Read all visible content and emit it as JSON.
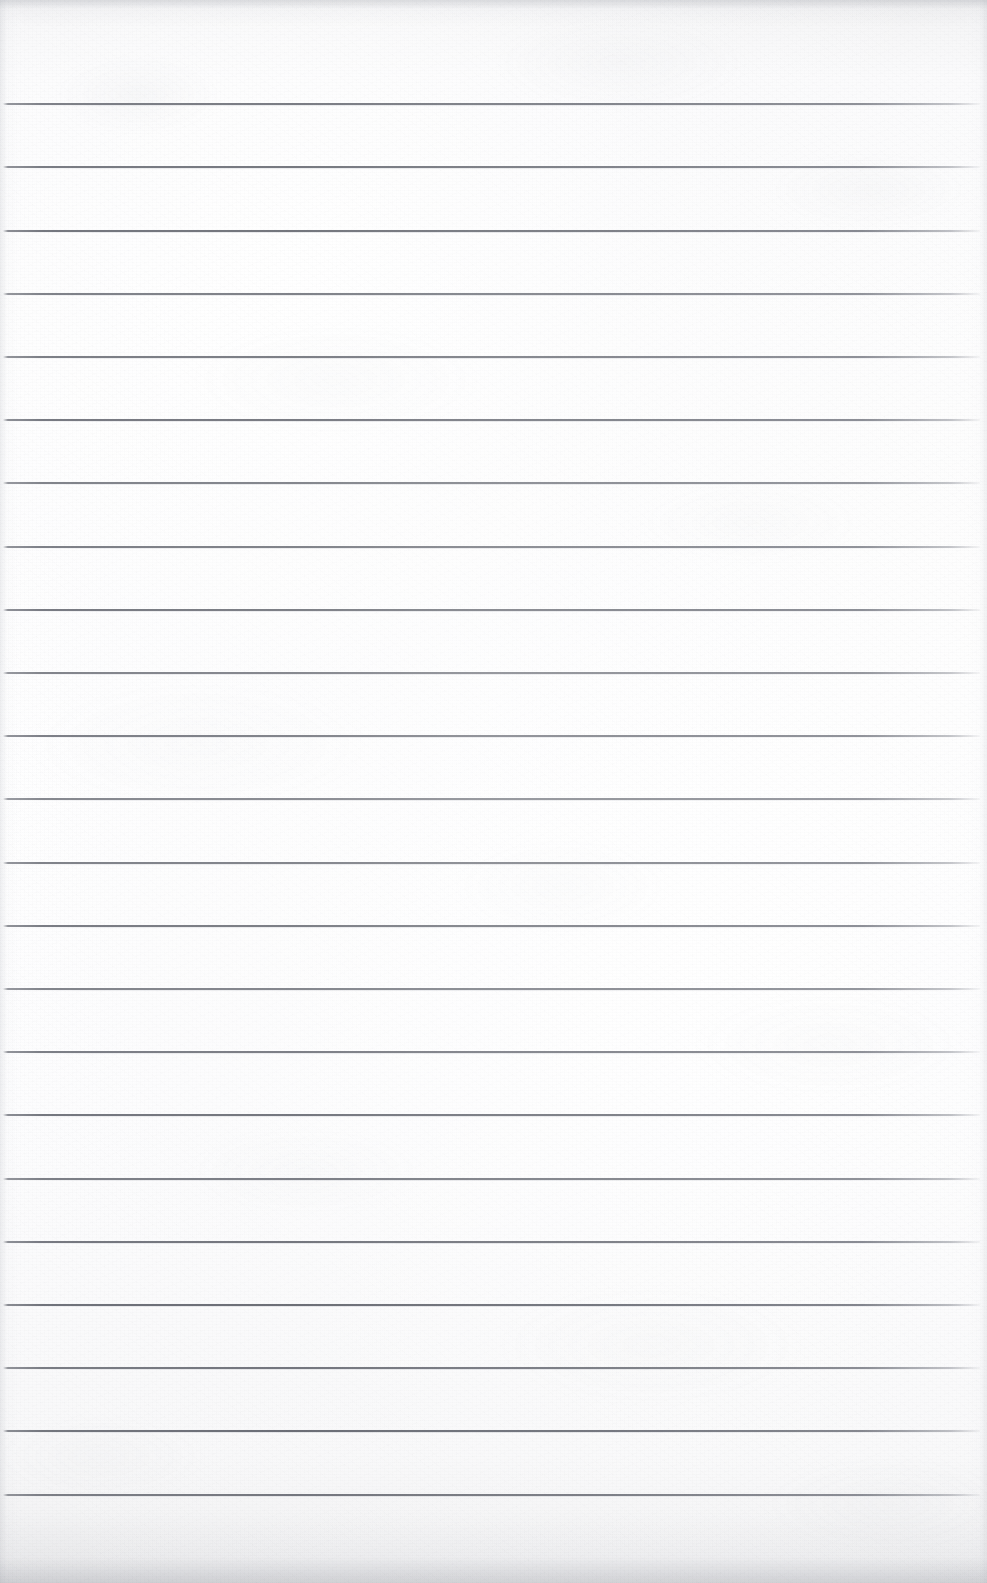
{
  "document": {
    "kind": "lined-notepad-paper-scan",
    "title": "Blank Ruled Notepad Page",
    "page_width": 987,
    "page_height": 1583,
    "text_content": "",
    "visible_text_lines": [],
    "content_note": "No handwriting, printing, headers, page numbers or markings are visible anywhere on the sheet."
  },
  "paper": {
    "base_color": "#fcfcfc",
    "highlight_color": "#ffffff",
    "shadow_color": "#eeeeef",
    "top_edge_shade": "#c4c6cb",
    "bottom_edge_shade": "#c4c6cb",
    "side_edge_shade": "#cdcfd4",
    "texture": "fine fibrous grain with soft mottled blotches"
  },
  "ruling": {
    "line_color": "#5c5f68",
    "line_thickness_px": 2,
    "line_count": 23,
    "first_line_y": 103,
    "line_spacing_px": 63.2,
    "left_margin_x": 3,
    "right_end_x": 980,
    "margin_rule": "none",
    "header_space_px": 103,
    "footer_space_px": 70,
    "line_y_positions": [
      103,
      166,
      230,
      293,
      356,
      419,
      482,
      546,
      609,
      672,
      735,
      798,
      862,
      925,
      988,
      1051,
      1114,
      1178,
      1241,
      1304,
      1367,
      1430,
      1494
    ]
  }
}
